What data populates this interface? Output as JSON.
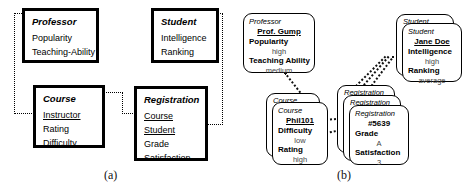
{
  "figure": {
    "captions": [
      {
        "label": "(a)"
      },
      {
        "label": "(b)"
      }
    ]
  },
  "schema": {
    "entities": [
      {
        "name": "Professor",
        "attributes": [
          {
            "label": "Popularity",
            "key": false
          },
          {
            "label": "Teaching-Ability",
            "key": false
          }
        ]
      },
      {
        "name": "Student",
        "attributes": [
          {
            "label": "Intelligence",
            "key": false
          },
          {
            "label": "Ranking",
            "key": false
          }
        ]
      },
      {
        "name": "Course",
        "attributes": [
          {
            "label": "Instructor",
            "key": true
          },
          {
            "label": "Rating",
            "key": false
          },
          {
            "label": "Difficulty",
            "key": false
          }
        ]
      },
      {
        "name": "Registration",
        "attributes": [
          {
            "label": "Course",
            "key": true
          },
          {
            "label": "Student",
            "key": true
          },
          {
            "label": "Grade",
            "key": false
          },
          {
            "label": "Satisfaction",
            "key": false
          }
        ]
      }
    ]
  },
  "instances": {
    "professor": {
      "class_label": "Professor",
      "id_label": "Prof. Gump",
      "fields": [
        {
          "name": "Popularity",
          "value": "high"
        },
        {
          "name": "Teaching Ability",
          "value": "medium"
        }
      ]
    },
    "student": {
      "ghost_label": "Student",
      "class_label": "Student",
      "id_label": "Jane Doe",
      "fields": [
        {
          "name": "Intelligence",
          "value": "high"
        },
        {
          "name": "Ranking",
          "value": "average"
        }
      ]
    },
    "course": {
      "ghost_label": "Course",
      "class_label": "Course",
      "id_label": "Phil101",
      "fields": [
        {
          "name": "Difficulty",
          "value": "low"
        },
        {
          "name": "Rating",
          "value": "high"
        }
      ]
    },
    "registration": {
      "ghost_label_back": "Registration",
      "ghost_label_mid": "Registration",
      "class_label": "Registration",
      "id_label": "#5639",
      "fields": [
        {
          "name": "Grade",
          "value": "A"
        },
        {
          "name": "Satisfaction",
          "value": "3"
        }
      ]
    }
  }
}
